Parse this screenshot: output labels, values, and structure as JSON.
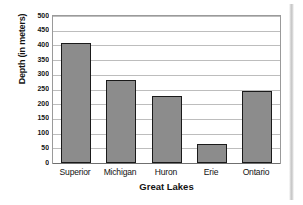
{
  "chart_data": {
    "type": "bar",
    "title": "",
    "xlabel": "Great Lakes",
    "ylabel": "Depth (in meters)",
    "categories": [
      "Superior",
      "Michigan",
      "Huron",
      "Erie",
      "Ontario"
    ],
    "values": [
      407,
      281,
      229,
      64,
      244
    ],
    "ylim": [
      0,
      500
    ],
    "ytick_step": 50,
    "yticks": [
      "500",
      "450",
      "400",
      "350",
      "300",
      "250",
      "200",
      "150",
      "100",
      "50",
      "0"
    ],
    "grid": "horizontal",
    "legend": "none",
    "bar_fill_color": "#8c8c8c",
    "bar_border_color": "#1a1a1a",
    "gridline_color": "#bdbdbd",
    "plot_border_color": "#9a9a9a",
    "text_color": "#131313"
  }
}
